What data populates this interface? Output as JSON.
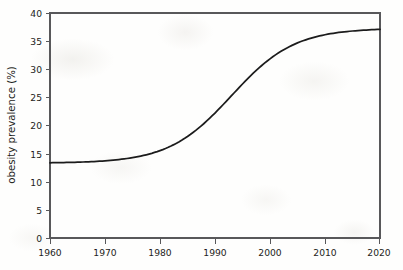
{
  "chart_data": {
    "type": "line",
    "title": "",
    "subtitle": "",
    "xlabel": "",
    "ylabel": "obesity prevalence (%)",
    "xlim": [
      1960,
      2020
    ],
    "ylim": [
      0,
      40
    ],
    "grid": false,
    "legend": "none",
    "x_ticks": [
      1960,
      1970,
      1980,
      1990,
      2000,
      2010,
      2020
    ],
    "x_tick_labels": [
      "1960",
      "1970",
      "1980",
      "1990",
      "2000",
      "2010",
      "2020"
    ],
    "y_ticks": [
      0,
      5,
      10,
      15,
      20,
      25,
      30,
      35,
      40
    ],
    "y_tick_labels": [
      "0",
      "5",
      "10",
      "15",
      "20",
      "25",
      "30",
      "35",
      "40"
    ],
    "line_color": "#1c1c1c",
    "line_width": 1.75,
    "series": [
      {
        "name": "obesity prevalence",
        "x": [
          1960,
          1962,
          1964,
          1966,
          1968,
          1970,
          1972,
          1974,
          1976,
          1978,
          1980,
          1982,
          1984,
          1986,
          1988,
          1990,
          1992,
          1994,
          1996,
          1998,
          2000,
          2002,
          2004,
          2006,
          2008,
          2010,
          2012,
          2014,
          2016,
          2018,
          2020
        ],
        "values": [
          13.3,
          13.3,
          13.3,
          13.4,
          13.4,
          13.5,
          13.7,
          13.9,
          14.2,
          14.6,
          15.2,
          16.0,
          17.0,
          18.3,
          19.9,
          21.8,
          23.9,
          26.1,
          28.2,
          30.1,
          31.8,
          33.2,
          34.3,
          35.2,
          35.8,
          36.3,
          36.6,
          36.9,
          37.0,
          37.1,
          37.2
        ]
      }
    ],
    "curve_model": {
      "shape": "logistic",
      "lower_asymptote": 13.3,
      "upper_asymptote": 37.3,
      "midpoint_year": 1993,
      "growth_rate": 0.175
    },
    "annotations": []
  },
  "axes": {
    "y_axis_title": "obesity prevalence (%)"
  }
}
